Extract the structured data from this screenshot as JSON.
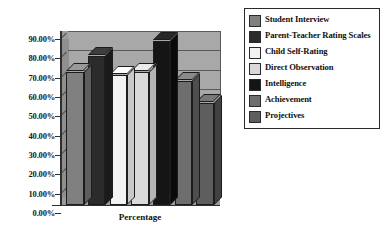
{
  "chart_data": {
    "type": "bar",
    "title": "",
    "xlabel": "Percentage",
    "ylabel": "",
    "ylim": [
      0,
      0.9
    ],
    "grid": true,
    "legend_position": "right",
    "style": "3d-grayscale-column",
    "categories": [
      "Student Interview",
      "Parent-Teacher Rating Scales",
      "Child Self-Rating",
      "Direct Observation",
      "Intelligence",
      "Achievement",
      "Projectives"
    ],
    "values": [
      0.69,
      0.77,
      0.67,
      0.69,
      0.85,
      0.64,
      0.53
    ],
    "value_labels": [
      "69.00%",
      "77.00%",
      "67.00%",
      "69.00%",
      "85.00%",
      "64.00%",
      "53.00%"
    ],
    "tick_labels": [
      "90.00%",
      "80.00%",
      "70.00%",
      "60.00%",
      "50.00%",
      "40.00%",
      "30.00%",
      "20.00%",
      "10.00%",
      "0.00%"
    ],
    "tick_values": [
      0.9,
      0.8,
      0.7,
      0.6,
      0.5,
      0.4,
      0.3,
      0.2,
      0.1,
      0.0
    ],
    "colors": [
      "#808080",
      "#2b2b2b",
      "#f2f2f2",
      "#d9d9d9",
      "#151515",
      "#6e6e6e",
      "#5e5e5e"
    ],
    "colors_top": [
      "#9a9a9a",
      "#3d3d3d",
      "#ffffff",
      "#eaeaea",
      "#272727",
      "#8a8a8a",
      "#787878"
    ],
    "colors_side": [
      "#5e5e5e",
      "#1a1a1a",
      "#c9c9c9",
      "#b4b4b4",
      "#0a0a0a",
      "#4e4e4e",
      "#414141"
    ],
    "plot_background": "#a8a8a8",
    "canvas_background": "#ffffff"
  },
  "legend": {
    "items": [
      {
        "label": "Student Interview",
        "swatch": "#808080"
      },
      {
        "label": "Parent-Teacher Rating Scales",
        "swatch": "#2b2b2b"
      },
      {
        "label": "Child Self-Rating",
        "swatch": "#f2f2f2"
      },
      {
        "label": "Direct Observation",
        "swatch": "#d9d9d9"
      },
      {
        "label": "Intelligence",
        "swatch": "#151515"
      },
      {
        "label": "Achievement",
        "swatch": "#6e6e6e"
      },
      {
        "label": "Projectives",
        "swatch": "#5e5e5e"
      }
    ]
  },
  "axes": {
    "x_title": "Percentage"
  }
}
